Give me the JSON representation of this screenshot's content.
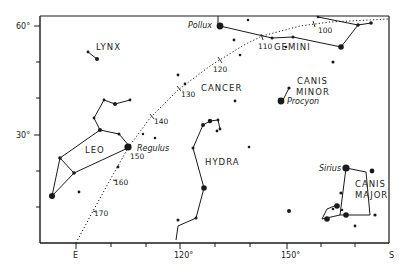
{
  "chart": {
    "type": "star-chart",
    "axes": {
      "left_labels": [
        {
          "text": "60°",
          "y": 26
        },
        {
          "text": "30°",
          "y": 135
        }
      ],
      "left_minor_ticks": [
        62,
        98,
        171,
        207
      ],
      "bottom_labels": [
        {
          "text": "E",
          "x": 76
        },
        {
          "text": "120°",
          "x": 180
        },
        {
          "text": "150°",
          "x": 287
        },
        {
          "text": "S",
          "x": 393
        }
      ],
      "bottom_minor_ticks": [
        111,
        146,
        215,
        250,
        321,
        355
      ]
    },
    "constellations": [
      {
        "name": "LYNX",
        "x": 96,
        "y": 50
      },
      {
        "name": "LEO",
        "x": 85,
        "y": 150
      },
      {
        "name": "CANCER",
        "x": 200,
        "y": 89
      },
      {
        "name": "HYDRA",
        "x": 205,
        "y": 163
      },
      {
        "name": "GEMINI",
        "x": 274,
        "y": 49
      },
      {
        "name": "CANIS",
        "x": 297,
        "y": 84
      },
      {
        "name": "MINOR",
        "x": 297,
        "y": 95
      },
      {
        "name": "CANIS",
        "x": 355,
        "y": 187
      },
      {
        "name": "MAJOR",
        "x": 355,
        "y": 198
      }
    ],
    "named_stars": [
      {
        "name": "Pollux",
        "x": 190,
        "y": 26
      },
      {
        "name": "Procyon",
        "x": 287,
        "y": 104
      },
      {
        "name": "Regulus",
        "x": 137,
        "y": 149
      },
      {
        "name": "Sirius",
        "x": 322,
        "y": 169
      }
    ],
    "ecliptic_marks": [
      {
        "label": "100",
        "x": 318,
        "y": 33
      },
      {
        "label": "110",
        "x": 258,
        "y": 49
      },
      {
        "label": "120",
        "x": 213,
        "y": 72
      },
      {
        "label": "130",
        "x": 183,
        "y": 97
      },
      {
        "label": "140",
        "x": 153,
        "y": 124
      },
      {
        "label": "150",
        "x": 130,
        "y": 158
      },
      {
        "label": "160",
        "x": 115,
        "y": 185
      },
      {
        "label": "170",
        "x": 95,
        "y": 216
      }
    ],
    "colors": {
      "ink": "#1a1a1a",
      "paper": "#ffffff"
    }
  }
}
